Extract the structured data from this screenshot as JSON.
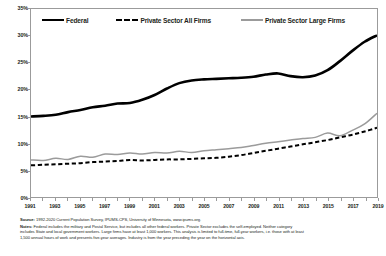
{
  "chart_data": {
    "type": "line",
    "title": "",
    "xlabel": "",
    "ylabel": "",
    "ylim": [
      0,
      35
    ],
    "xlim": [
      1991,
      2019
    ],
    "grid": false,
    "legend_position": "top-inside",
    "ytick_labels": [
      "35%",
      "30%",
      "25%",
      "20%",
      "15%",
      "10%",
      "5%",
      "0%"
    ],
    "ytick_values": [
      35,
      30,
      25,
      20,
      15,
      10,
      5,
      0
    ],
    "xtick_labels": [
      "1991",
      "1993",
      "1995",
      "1997",
      "1999",
      "2001",
      "2003",
      "2005",
      "2007",
      "2009",
      "2011",
      "2013",
      "2015",
      "2017",
      "2019"
    ],
    "x": [
      1991,
      1992,
      1993,
      1994,
      1995,
      1996,
      1997,
      1998,
      1999,
      2000,
      2001,
      2002,
      2003,
      2004,
      2005,
      2006,
      2007,
      2008,
      2009,
      2010,
      2011,
      2012,
      2013,
      2014,
      2015,
      2016,
      2017,
      2018,
      2019
    ],
    "series": [
      {
        "name": "Federal",
        "style": "solid-thick-black",
        "color": "#000000",
        "values": [
          15.0,
          15.1,
          15.3,
          15.8,
          16.2,
          16.7,
          17.0,
          17.4,
          17.5,
          18.1,
          19.0,
          20.2,
          21.2,
          21.7,
          21.9,
          22.0,
          22.1,
          22.2,
          22.4,
          22.8,
          23.0,
          22.5,
          22.3,
          22.6,
          23.6,
          25.3,
          27.2,
          28.9,
          30.1
        ]
      },
      {
        "name": "Private Sector All Firms",
        "style": "dashed-black",
        "color": "#000000",
        "values": [
          5.9,
          6.0,
          6.1,
          6.2,
          6.3,
          6.5,
          6.6,
          6.7,
          6.9,
          6.8,
          6.9,
          7.0,
          7.0,
          7.1,
          7.2,
          7.3,
          7.5,
          7.8,
          8.2,
          8.6,
          9.0,
          9.4,
          9.8,
          10.2,
          10.6,
          11.1,
          11.6,
          12.2,
          12.9
        ]
      },
      {
        "name": "Private Sector Large Firms",
        "style": "solid-gray",
        "color": "#9b9b9b",
        "values": [
          6.9,
          6.8,
          7.2,
          7.0,
          7.6,
          7.4,
          8.0,
          7.9,
          8.2,
          8.0,
          8.3,
          8.2,
          8.5,
          8.3,
          8.6,
          8.8,
          9.0,
          9.2,
          9.6,
          10.0,
          10.3,
          10.6,
          10.9,
          11.1,
          11.9,
          11.4,
          12.4,
          13.6,
          15.6
        ]
      }
    ]
  },
  "legend": {
    "items": [
      {
        "label": "Federal",
        "swatch": "solid-line-black"
      },
      {
        "label": "Private Sector All Firms",
        "swatch": "dashed-line-black"
      },
      {
        "label": "Private Sector Large Firms",
        "swatch": "solid-line-gray"
      }
    ]
  },
  "footnotes": {
    "source_label": "Source:",
    "source_text": "1992-2020 Current Population Survey, IPUMS-CPS, University of Minnesota, www.ipums.org.",
    "notes_label": "Notes:",
    "notes_line1": "Federal includes the military and Postal Service, but includes all other federal workers.  Private Sector excludes the self-employed.  Neither category",
    "notes_line2": "includes State and local government workers. Large firms have at least 1,000 workers. This analysis is limited to full-time, full-year workers, i.e. those with at least",
    "notes_line3": "1,500 annual hours of work and presents five-year  averages.  Industry is from the year preceding the year on the horizontal axis."
  }
}
